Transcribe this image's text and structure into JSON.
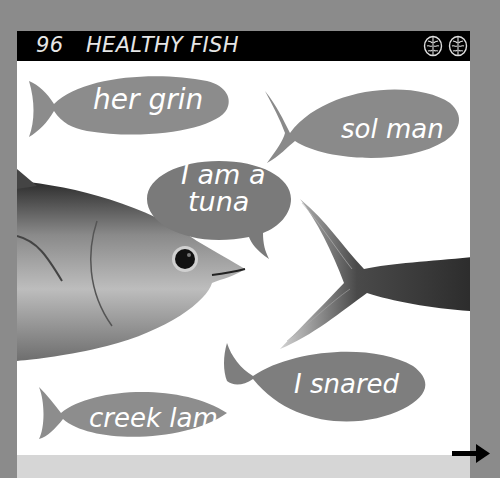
{
  "header": {
    "page_number": "96",
    "title": "HEALTHY FISH",
    "icons": [
      "brain-icon",
      "brain-icon"
    ]
  },
  "fish_bubbles": [
    {
      "id": "her-grin",
      "label": "her grin",
      "color": "#8c8c8c"
    },
    {
      "id": "sol-man",
      "label": "sol man",
      "color": "#8a8a8a"
    },
    {
      "id": "creek-lam",
      "label": "creek lam",
      "color": "#8d8d8d"
    },
    {
      "id": "i-snared",
      "label": "I snared",
      "color": "#7e7e7e"
    }
  ],
  "speech_bubble": {
    "line1": "I am a",
    "line2": "tuna",
    "color": "#7a7a7a"
  },
  "images": {
    "tuna_head": "tuna-head-photo",
    "tuna_tail": "tuna-tail-photo"
  },
  "navigation": {
    "next_arrow": "arrow-right-icon"
  },
  "colors": {
    "background": "#8b8b8b",
    "page": "#ffffff",
    "header_bar": "#000000",
    "bottom_strip": "#d6d6d6"
  }
}
